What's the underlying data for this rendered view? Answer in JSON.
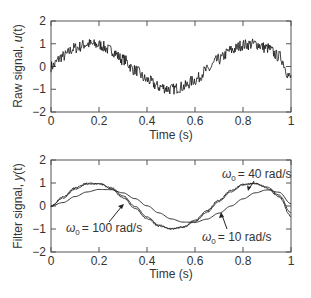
{
  "chart_data": [
    {
      "type": "line",
      "title": "",
      "xlabel": "Time (s)",
      "ylabel": "Raw signal, u(t)",
      "xlim": [
        0,
        1
      ],
      "ylim": [
        -2,
        2
      ],
      "xticks": [
        "0",
        "0.2",
        "0.4",
        "0.6",
        "0.8",
        "1"
      ],
      "yticks": [
        "2",
        "1",
        "0",
        "−1",
        "−2"
      ],
      "grid": false,
      "series": [
        {
          "name": "Raw signal u(t) (noisy sinusoid)",
          "x": [
            0,
            0.05,
            0.1,
            0.15,
            0.2,
            0.25,
            0.3,
            0.35,
            0.4,
            0.45,
            0.5,
            0.55,
            0.6,
            0.65,
            0.7,
            0.75,
            0.8,
            0.85,
            0.9,
            0.95,
            1.0
          ],
          "values": [
            0.0,
            0.45,
            0.81,
            0.99,
            0.95,
            0.71,
            0.31,
            -0.16,
            -0.59,
            -0.89,
            -1.0,
            -0.89,
            -0.59,
            -0.16,
            0.31,
            0.71,
            0.95,
            0.99,
            0.81,
            0.45,
            -0.5
          ],
          "noise_amplitude": 0.25
        }
      ]
    },
    {
      "type": "line",
      "title": "",
      "xlabel": "Time (s)",
      "ylabel": "Filter signal, y(t)",
      "xlim": [
        0,
        1
      ],
      "ylim": [
        -2,
        2
      ],
      "xticks": [
        "0",
        "0.2",
        "0.4",
        "0.6",
        "0.8",
        "1"
      ],
      "yticks": [
        "2",
        "1",
        "0",
        "−1",
        "−2"
      ],
      "grid": false,
      "series": [
        {
          "name": "ω₀ = 100 rad/s",
          "x": [
            0,
            0.05,
            0.1,
            0.15,
            0.2,
            0.25,
            0.3,
            0.35,
            0.4,
            0.45,
            0.5,
            0.55,
            0.6,
            0.65,
            0.7,
            0.75,
            0.8,
            0.85,
            0.9,
            0.95,
            1.0
          ],
          "values": [
            0.0,
            0.4,
            0.78,
            0.98,
            0.97,
            0.75,
            0.37,
            -0.1,
            -0.55,
            -0.87,
            -1.0,
            -0.91,
            -0.63,
            -0.2,
            0.26,
            0.67,
            0.94,
            0.99,
            0.78,
            0.4,
            -0.45
          ]
        },
        {
          "name": "ω₀ = 40 rad/s",
          "x": [
            0,
            0.05,
            0.1,
            0.15,
            0.2,
            0.25,
            0.3,
            0.35,
            0.4,
            0.45,
            0.5,
            0.55,
            0.6,
            0.65,
            0.7,
            0.75,
            0.8,
            0.85,
            0.9,
            0.95,
            1.0
          ],
          "values": [
            0.0,
            0.35,
            0.73,
            0.95,
            0.98,
            0.8,
            0.44,
            -0.02,
            -0.48,
            -0.83,
            -0.99,
            -0.93,
            -0.68,
            -0.27,
            0.2,
            0.62,
            0.91,
            0.98,
            0.83,
            0.48,
            -0.3
          ]
        },
        {
          "name": "ω₀ = 10 rad/s",
          "x": [
            0,
            0.05,
            0.1,
            0.15,
            0.2,
            0.25,
            0.3,
            0.35,
            0.4,
            0.45,
            0.5,
            0.55,
            0.6,
            0.65,
            0.7,
            0.75,
            0.8,
            0.85,
            0.9,
            0.95,
            1.0
          ],
          "values": [
            0.0,
            0.15,
            0.41,
            0.61,
            0.72,
            0.71,
            0.57,
            0.32,
            0.01,
            -0.3,
            -0.56,
            -0.7,
            -0.71,
            -0.57,
            -0.31,
            -0.0,
            0.31,
            0.57,
            0.7,
            0.6,
            0.1
          ]
        }
      ],
      "annotations": [
        {
          "text": "ω₀ = 40 rad/s",
          "x": 0.82,
          "y": 1.75,
          "arrow_to": [
            0.82,
            0.95
          ]
        },
        {
          "text": "ω₀ = 100 rad/s",
          "x": 0.15,
          "y": -0.9,
          "arrow_to": [
            0.3,
            0.55
          ]
        },
        {
          "text": "ω₀ = 10 rad/s",
          "x": 0.75,
          "y": -1.1,
          "arrow_to": [
            0.7,
            -0.3
          ]
        }
      ]
    }
  ],
  "plots": {
    "top": {
      "ylabel_main": "Raw signal, ",
      "ylabel_var": "u",
      "ylabel_arg": "(t)",
      "xlabel": "Time (s)"
    },
    "bottom": {
      "ylabel_main": "Filter signal, ",
      "ylabel_var": "y",
      "ylabel_arg": "(t)",
      "xlabel": "Time (s)",
      "annot_40": "= 40 rad/s",
      "annot_100": "= 100 rad/s",
      "annot_10": "= 10 rad/s",
      "omega": "ω",
      "omega_sub": "0"
    }
  }
}
